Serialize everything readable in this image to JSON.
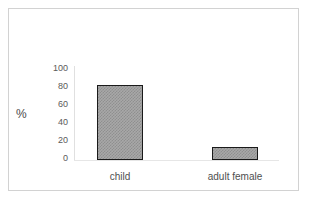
{
  "chart_data": {
    "type": "bar",
    "title": "",
    "subtitle": "",
    "xlabel": "",
    "ylabel": "%",
    "categories": [
      "child",
      "adult female"
    ],
    "values": [
      82,
      14
    ],
    "series": [
      {
        "name": "percent",
        "values": [
          82,
          14
        ]
      }
    ],
    "ylim": [
      0,
      100
    ],
    "yticks": [
      "100",
      "80",
      "60",
      "40",
      "20",
      "0"
    ],
    "ytick_values": [
      100,
      80,
      60,
      40,
      20,
      0
    ],
    "grid": false,
    "legend": false,
    "legend_position": "none",
    "annotations": [],
    "colors": {
      "bar_fill": "#a8a8a8",
      "bar_pattern": "#8f8f8f",
      "bar_border": "#1a1a1a",
      "axis_text": "#5a5a5a",
      "frame_border": "#d2d2d2",
      "background": "#ffffff"
    }
  }
}
